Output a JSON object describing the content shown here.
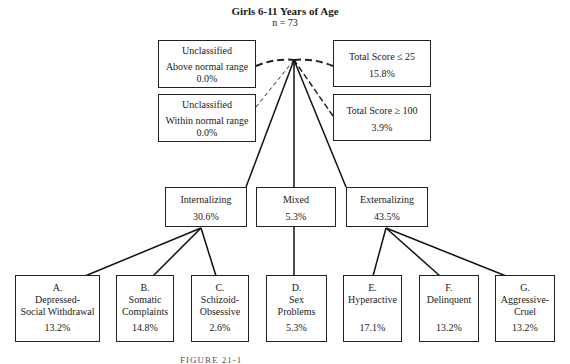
{
  "header": {
    "title": "Girls 6-11 Years of Age",
    "n": "n = 73"
  },
  "unclassified": [
    {
      "label": "Unclassified",
      "sub": "Above normal range",
      "pct": "0.0%"
    },
    {
      "label": "Unclassified",
      "sub": "Within normal range",
      "pct": "0.0%"
    }
  ],
  "total_score": [
    {
      "label": "Total Score ≤ 25",
      "pct": "15.8%"
    },
    {
      "label": "Total Score ≥ 100",
      "pct": "3.9%"
    }
  ],
  "groups": [
    {
      "label": "Internalizing",
      "pct": "30.6%"
    },
    {
      "label": "Mixed",
      "pct": "5.3%"
    },
    {
      "label": "Externalizing",
      "pct": "43.5%"
    }
  ],
  "factors": [
    {
      "letter": "A.",
      "line1": "Depressed-",
      "line2": "Social Withdrawal",
      "pct": "13.2%"
    },
    {
      "letter": "B.",
      "line1": "Somatic",
      "line2": "Complaints",
      "pct": "14.8%"
    },
    {
      "letter": "C.",
      "line1": "Schizoid-",
      "line2": "Obsessive",
      "pct": "2.6%"
    },
    {
      "letter": "D.",
      "line1": "Sex",
      "line2": "Problems",
      "pct": "5.3%"
    },
    {
      "letter": "E.",
      "line1": "Hyperactive",
      "line2": "",
      "pct": "17.1%"
    },
    {
      "letter": "F.",
      "line1": "Delinquent",
      "line2": "",
      "pct": "13.2%"
    },
    {
      "letter": "G.",
      "line1": "Aggressive-",
      "line2": "Cruel",
      "pct": "13.2%"
    }
  ],
  "caption": "FIGURE 21-1"
}
